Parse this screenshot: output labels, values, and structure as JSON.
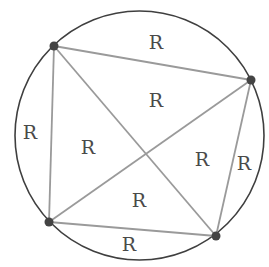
{
  "diagram": {
    "title": "",
    "circle": {
      "cx": 139.5,
      "cy": 135.5,
      "r": 124.5,
      "stroke": "#3f3f3f"
    },
    "line_color": "#9a9a9a",
    "point_color": "#444444",
    "points": [
      {
        "id": "A",
        "x": 54,
        "y": 46
      },
      {
        "id": "B",
        "x": 251,
        "y": 80
      },
      {
        "id": "C",
        "x": 216,
        "y": 236
      },
      {
        "id": "D",
        "x": 49,
        "y": 222
      }
    ],
    "segments": [
      {
        "from": "A",
        "to": "B"
      },
      {
        "from": "B",
        "to": "C"
      },
      {
        "from": "C",
        "to": "D"
      },
      {
        "from": "D",
        "to": "A"
      },
      {
        "from": "A",
        "to": "C"
      },
      {
        "from": "B",
        "to": "D"
      }
    ],
    "labels": [
      {
        "name": "region-top-segment",
        "text": "R",
        "x": 156,
        "y": 49
      },
      {
        "name": "region-inner-top",
        "text": "R",
        "x": 156,
        "y": 107
      },
      {
        "name": "region-left-segment",
        "text": "R",
        "x": 30,
        "y": 139
      },
      {
        "name": "region-inner-left",
        "text": "R",
        "x": 88,
        "y": 154
      },
      {
        "name": "region-inner-right",
        "text": "R",
        "x": 202,
        "y": 166
      },
      {
        "name": "region-right-segment",
        "text": "R",
        "x": 244,
        "y": 170
      },
      {
        "name": "region-inner-bottom",
        "text": "R",
        "x": 139,
        "y": 207
      },
      {
        "name": "region-bottom-segment",
        "text": "R",
        "x": 129,
        "y": 251
      }
    ]
  }
}
